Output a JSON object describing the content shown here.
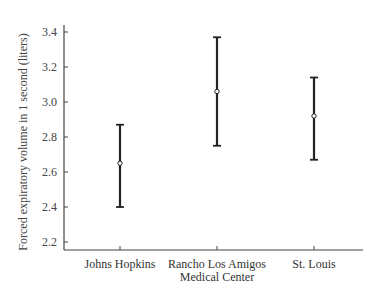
{
  "chart_data": {
    "type": "errorbar",
    "title": "",
    "xlabel": "",
    "ylabel": "Forced expiratory volume in 1 second (liters)",
    "ylim": [
      2.15,
      3.45
    ],
    "yticks": [
      2.2,
      2.4,
      2.6,
      2.8,
      3.0,
      3.2,
      3.4
    ],
    "ytick_labels": [
      "2.2",
      "2.4",
      "2.6",
      "2.8",
      "3.0",
      "3.2",
      "3.4"
    ],
    "grid": false,
    "legend": null,
    "categories": [
      [
        "Johns Hopkins"
      ],
      [
        "Rancho Los Amigos",
        "Medical Center"
      ],
      [
        "St. Louis"
      ]
    ],
    "series": [
      {
        "name": "FEV1",
        "mean": [
          2.65,
          3.06,
          2.92
        ],
        "lower": [
          2.4,
          2.75,
          2.67
        ],
        "upper": [
          2.87,
          3.37,
          3.14
        ]
      }
    ]
  }
}
